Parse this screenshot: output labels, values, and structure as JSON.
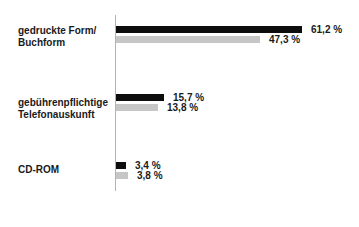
{
  "chart_data": {
    "type": "bar",
    "orientation": "horizontal",
    "title": "",
    "unit": "%",
    "grid": false,
    "legend": false,
    "xlim": [
      0,
      70
    ],
    "series_colors": {
      "primary": "#0d0d0d",
      "secondary": "#c6c6c6"
    },
    "axis_color": "#b3b3b3",
    "groups": [
      {
        "category_lines": [
          "gedruckte Form/",
          "Buchform"
        ],
        "primary": {
          "value": 61.2,
          "label": "61,2 %"
        },
        "secondary": {
          "value": 47.3,
          "label": "47,3 %"
        }
      },
      {
        "category_lines": [
          "gebührenpflichtige",
          "Telefonauskunft"
        ],
        "primary": {
          "value": 15.7,
          "label": "15,7 %"
        },
        "secondary": {
          "value": 13.8,
          "label": "13,8 %"
        }
      },
      {
        "category_lines": [
          "CD-ROM"
        ],
        "primary": {
          "value": 3.4,
          "label": "3,4 %"
        },
        "secondary": {
          "value": 3.8,
          "label": "3,8 %"
        }
      }
    ]
  }
}
